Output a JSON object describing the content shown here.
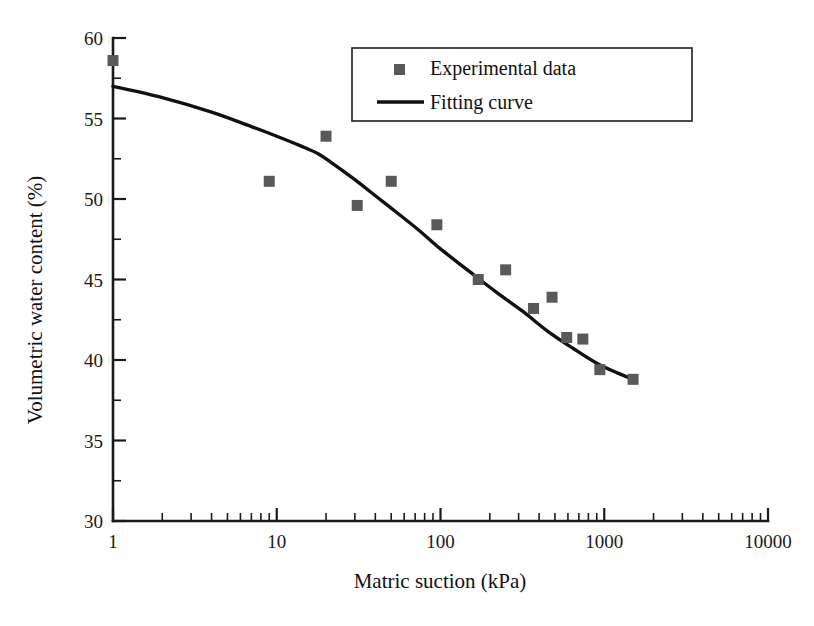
{
  "chart_data": {
    "type": "scatter",
    "title": "",
    "xlabel": "Matric suction (kPa)",
    "ylabel": "Volumetric water content (%)",
    "xscale": "log",
    "yscale": "linear",
    "xlim": [
      1,
      10000
    ],
    "ylim": [
      30,
      60
    ],
    "grid": false,
    "legend_position": "top-center",
    "x_ticklabels": [
      "1",
      "10",
      "100",
      "1000",
      "10000"
    ],
    "x_tickvalues": [
      1,
      10,
      100,
      1000,
      10000
    ],
    "y_ticklabels": [
      "30",
      "35",
      "40",
      "45",
      "50",
      "55",
      "60"
    ],
    "y_tickvalues": [
      30,
      35,
      40,
      45,
      50,
      55,
      60
    ],
    "y_minor_tickvalues": [
      32.5,
      37.5,
      42.5,
      47.5,
      52.5,
      57.5
    ],
    "series": [
      {
        "name": "Experimental data",
        "type": "scatter",
        "marker": "square",
        "color": "#595959",
        "points": [
          {
            "x": 1,
            "y": 58.6
          },
          {
            "x": 9,
            "y": 51.1
          },
          {
            "x": 20,
            "y": 53.9
          },
          {
            "x": 31,
            "y": 49.6
          },
          {
            "x": 50,
            "y": 51.1
          },
          {
            "x": 95,
            "y": 48.4
          },
          {
            "x": 170,
            "y": 45.0
          },
          {
            "x": 250,
            "y": 45.6
          },
          {
            "x": 370,
            "y": 43.2
          },
          {
            "x": 480,
            "y": 43.9
          },
          {
            "x": 590,
            "y": 41.4
          },
          {
            "x": 740,
            "y": 41.3
          },
          {
            "x": 940,
            "y": 39.4
          },
          {
            "x": 1500,
            "y": 38.8
          }
        ]
      },
      {
        "name": "Fitting curve",
        "type": "line",
        "color": "#111111",
        "points": [
          {
            "x": 1,
            "y": 57.0
          },
          {
            "x": 2,
            "y": 56.3
          },
          {
            "x": 4,
            "y": 55.4
          },
          {
            "x": 7,
            "y": 54.5
          },
          {
            "x": 10,
            "y": 53.9
          },
          {
            "x": 14,
            "y": 53.3
          },
          {
            "x": 18,
            "y": 52.8
          },
          {
            "x": 22,
            "y": 52.2
          },
          {
            "x": 30,
            "y": 51.2
          },
          {
            "x": 40,
            "y": 50.2
          },
          {
            "x": 55,
            "y": 49.1
          },
          {
            "x": 75,
            "y": 48.0
          },
          {
            "x": 100,
            "y": 46.9
          },
          {
            "x": 150,
            "y": 45.5
          },
          {
            "x": 220,
            "y": 44.2
          },
          {
            "x": 320,
            "y": 43.0
          },
          {
            "x": 450,
            "y": 41.8
          },
          {
            "x": 650,
            "y": 40.7
          },
          {
            "x": 900,
            "y": 39.8
          },
          {
            "x": 1200,
            "y": 39.2
          },
          {
            "x": 1500,
            "y": 38.8
          }
        ]
      }
    ]
  },
  "legend": {
    "entries": [
      {
        "label": "Experimental data",
        "marker": "square",
        "color": "#595959"
      },
      {
        "label": "Fitting curve",
        "marker": "line",
        "color": "#111111"
      }
    ]
  }
}
